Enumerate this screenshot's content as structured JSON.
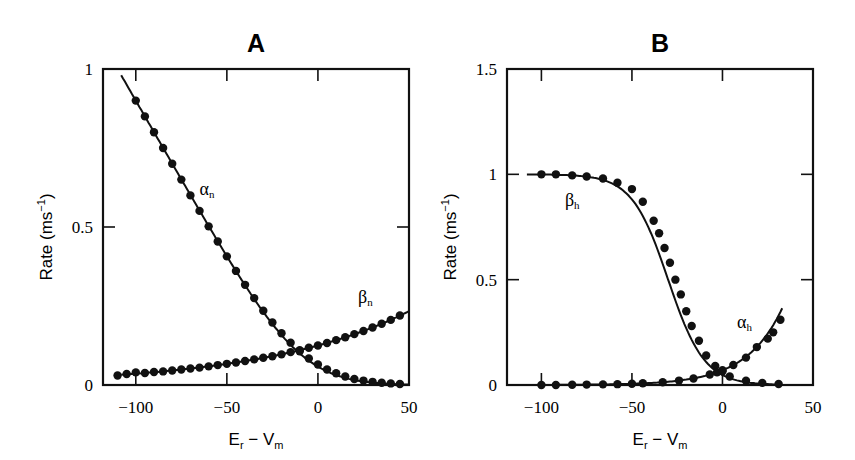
{
  "chart_data": [
    {
      "type": "line",
      "title": "A",
      "xlabel": "E_r − V_m",
      "ylabel": "Rate (ms⁻¹)",
      "xlim": [
        -118,
        50
      ],
      "ylim": [
        0,
        1
      ],
      "xticks": [
        -100,
        -50,
        0,
        50
      ],
      "yticks": [
        0,
        0.5,
        1
      ],
      "ytick_labels": [
        "0",
        "0.5",
        "1"
      ],
      "grid": false,
      "series": [
        {
          "name": "α_n",
          "label_pos": [
            -65,
            0.6
          ],
          "fit": "alpha_n",
          "x": [
            -100,
            -95,
            -90,
            -85,
            -80,
            -75,
            -70,
            -65,
            -60,
            -55,
            -50,
            -45,
            -40,
            -35,
            -30,
            -25,
            -20,
            -15,
            -10,
            -5,
            0,
            5,
            10,
            15,
            20,
            25,
            30,
            35,
            40,
            45
          ],
          "y": [
            0.9,
            0.85,
            0.8,
            0.75,
            0.7,
            0.65,
            0.6,
            0.551,
            0.502,
            0.454,
            0.407,
            0.361,
            0.317,
            0.275,
            0.235,
            0.198,
            0.164,
            0.134,
            0.107,
            0.084,
            0.065,
            0.049,
            0.037,
            0.027,
            0.019,
            0.014,
            0.01,
            0.007,
            0.005,
            0.003
          ]
        },
        {
          "name": "β_n",
          "label_pos": [
            22,
            0.26
          ],
          "fit": "beta_n",
          "x": [
            -110,
            -105,
            -100,
            -95,
            -90,
            -85,
            -80,
            -75,
            -70,
            -65,
            -60,
            -55,
            -50,
            -45,
            -40,
            -35,
            -30,
            -25,
            -20,
            -15,
            -10,
            -5,
            0,
            5,
            10,
            15,
            20,
            25,
            30,
            35,
            40,
            45
          ],
          "y": [
            0.03,
            0.035,
            0.04,
            0.038,
            0.041,
            0.043,
            0.046,
            0.049,
            0.052,
            0.055,
            0.059,
            0.063,
            0.067,
            0.071,
            0.076,
            0.081,
            0.086,
            0.091,
            0.097,
            0.104,
            0.11,
            0.118,
            0.125,
            0.133,
            0.142,
            0.151,
            0.161,
            0.171,
            0.182,
            0.194,
            0.206,
            0.22
          ]
        }
      ]
    },
    {
      "type": "line",
      "title": "B",
      "xlabel": "E_r − V_m",
      "ylabel": "Rate (ms⁻¹)",
      "xlim": [
        -119,
        50
      ],
      "ylim": [
        0,
        1.5
      ],
      "xticks": [
        -100,
        -50,
        0,
        50
      ],
      "yticks": [
        0,
        0.5,
        1,
        1.5
      ],
      "ytick_labels": [
        "0",
        "0.5",
        "1",
        "1.5"
      ],
      "grid": false,
      "series": [
        {
          "name": "β_h",
          "label_pos": [
            -87,
            0.85
          ],
          "fit": "beta_h",
          "x": [
            -100,
            -92,
            -83,
            -75,
            -66,
            -58,
            -50,
            -44,
            -38,
            -35,
            -32,
            -29,
            -26,
            -23,
            -20,
            -17,
            -13,
            -9,
            -4,
            0,
            4,
            13,
            22,
            31
          ],
          "y": [
            1.0,
            1.0,
            0.995,
            0.99,
            0.98,
            0.96,
            0.93,
            0.87,
            0.78,
            0.72,
            0.65,
            0.58,
            0.5,
            0.43,
            0.35,
            0.28,
            0.21,
            0.14,
            0.09,
            0.065,
            0.04,
            0.02,
            0.01,
            0.005
          ]
        },
        {
          "name": "α_h",
          "label_pos": [
            8,
            0.27
          ],
          "fit": "alpha_h",
          "x": [
            -100,
            -92,
            -83,
            -75,
            -66,
            -58,
            -50,
            -44,
            -33,
            -24,
            -16,
            -7,
            -3,
            0,
            6,
            13,
            19,
            25,
            28,
            32
          ],
          "y": [
            0.0,
            0.0,
            0.001,
            0.002,
            0.003,
            0.004,
            0.006,
            0.008,
            0.013,
            0.021,
            0.031,
            0.05,
            0.06,
            0.07,
            0.095,
            0.13,
            0.18,
            0.22,
            0.25,
            0.31
          ]
        }
      ]
    }
  ]
}
